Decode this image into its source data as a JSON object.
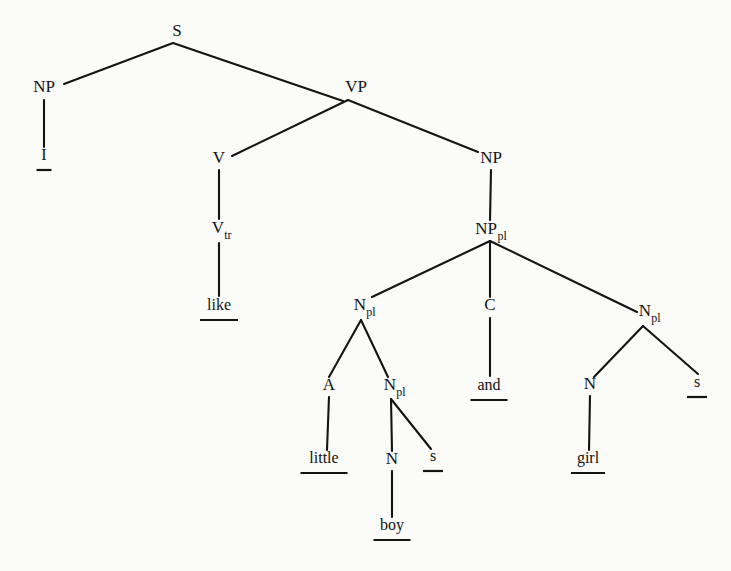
{
  "figure": {
    "name": "constituency-parse-tree",
    "sentence": "I like little boys and girls",
    "background_color": "#fbfbfa",
    "ink_color": "#141414"
  },
  "nodes": [
    {
      "id": "S",
      "label": "S",
      "sub": "",
      "x": 177,
      "y": 36,
      "anchor_x": 173,
      "anchor_y": 43,
      "kind": "nonterminal"
    },
    {
      "id": "NP1",
      "label": "NP",
      "sub": "",
      "x": 44,
      "y": 92,
      "anchor_x": 44,
      "anchor_y": 100,
      "kind": "nonterminal"
    },
    {
      "id": "VP",
      "label": "VP",
      "sub": "",
      "x": 356,
      "y": 92,
      "anchor_x": 348,
      "anchor_y": 100,
      "kind": "nonterminal"
    },
    {
      "id": "V",
      "label": "V",
      "sub": "",
      "x": 219,
      "y": 163,
      "anchor_x": 219,
      "anchor_y": 170,
      "kind": "nonterminal"
    },
    {
      "id": "NP2",
      "label": "NP",
      "sub": "",
      "x": 491,
      "y": 163,
      "anchor_x": 491,
      "anchor_y": 170,
      "kind": "nonterminal"
    },
    {
      "id": "Vtr",
      "label": "V",
      "sub": "tr",
      "x": 218,
      "y": 233,
      "anchor_x": 219,
      "anchor_y": 241,
      "kind": "nonterminal"
    },
    {
      "id": "NPpl",
      "label": "NP",
      "sub": "pl",
      "x": 486,
      "y": 234,
      "anchor_x": 490,
      "anchor_y": 241,
      "kind": "nonterminal"
    },
    {
      "id": "Npl_L",
      "label": "N",
      "sub": "pl",
      "x": 360,
      "y": 310,
      "anchor_x": 361,
      "anchor_y": 319,
      "kind": "nonterminal"
    },
    {
      "id": "C",
      "label": "C",
      "sub": "",
      "x": 490,
      "y": 310,
      "anchor_x": 490,
      "anchor_y": 318,
      "kind": "nonterminal"
    },
    {
      "id": "Npl_R",
      "label": "N",
      "sub": "pl",
      "x": 645,
      "y": 316,
      "anchor_x": 644,
      "anchor_y": 325,
      "kind": "nonterminal"
    },
    {
      "id": "A",
      "label": "A",
      "sub": "",
      "x": 329,
      "y": 390,
      "anchor_x": 329,
      "anchor_y": 397,
      "kind": "nonterminal"
    },
    {
      "id": "Npl_inner",
      "label": "N",
      "sub": "pl",
      "x": 390,
      "y": 390,
      "anchor_x": 391,
      "anchor_y": 398,
      "kind": "nonterminal"
    },
    {
      "id": "N_girl",
      "label": "N",
      "sub": "",
      "x": 590,
      "y": 389,
      "anchor_x": 590,
      "anchor_y": 396,
      "kind": "nonterminal"
    },
    {
      "id": "N_boy",
      "label": "N",
      "sub": "",
      "x": 392,
      "y": 464,
      "anchor_x": 392,
      "anchor_y": 471,
      "kind": "nonterminal"
    }
  ],
  "leaves": [
    {
      "id": "leaf_I",
      "text": "I",
      "x": 44,
      "y": 160,
      "underline_width": 15,
      "underline_y": 170
    },
    {
      "id": "leaf_like",
      "text": "like",
      "x": 219,
      "y": 310,
      "underline_width": 38,
      "underline_y": 320
    },
    {
      "id": "leaf_little",
      "text": "little",
      "x": 324,
      "y": 463,
      "underline_width": 47,
      "underline_y": 473
    },
    {
      "id": "leaf_s1",
      "text": "s",
      "x": 433,
      "y": 461,
      "underline_width": 20,
      "underline_y": 471
    },
    {
      "id": "leaf_and",
      "text": "and",
      "x": 489,
      "y": 390,
      "underline_width": 37,
      "underline_y": 400
    },
    {
      "id": "leaf_girl",
      "text": "girl",
      "x": 588,
      "y": 463,
      "underline_width": 34,
      "underline_y": 473
    },
    {
      "id": "leaf_s2",
      "text": "s",
      "x": 697,
      "y": 387,
      "underline_width": 20,
      "underline_y": 397
    },
    {
      "id": "leaf_boy",
      "text": "boy",
      "x": 392,
      "y": 530,
      "underline_width": 37,
      "underline_y": 540
    }
  ],
  "edges": [
    {
      "id": "e-S-NP1",
      "from": "S",
      "to": "NP1",
      "x1": 173,
      "y1": 43,
      "x2": 64,
      "y2": 84
    },
    {
      "id": "e-S-VP",
      "from": "S",
      "to": "VP",
      "x1": 173,
      "y1": 43,
      "x2": 343,
      "y2": 101
    },
    {
      "id": "e-NP1-I",
      "from": "NP1",
      "to": "leaf_I",
      "x1": 44,
      "y1": 100,
      "x2": 44,
      "y2": 147
    },
    {
      "id": "e-VP-V",
      "from": "VP",
      "to": "V",
      "x1": 348,
      "y1": 100,
      "x2": 232,
      "y2": 156
    },
    {
      "id": "e-VP-NP2",
      "from": "VP",
      "to": "NP2",
      "x1": 348,
      "y1": 100,
      "x2": 478,
      "y2": 152
    },
    {
      "id": "e-V-Vtr",
      "from": "V",
      "to": "Vtr",
      "x1": 219,
      "y1": 170,
      "x2": 219,
      "y2": 219
    },
    {
      "id": "e-Vtr-like",
      "from": "Vtr",
      "to": "leaf_like",
      "x1": 219,
      "y1": 243,
      "x2": 219,
      "y2": 296
    },
    {
      "id": "e-NP2-NPpl",
      "from": "NP2",
      "to": "NPpl",
      "x1": 491,
      "y1": 170,
      "x2": 490,
      "y2": 220
    },
    {
      "id": "e-NPpl-NplL",
      "from": "NPpl",
      "to": "Npl_L",
      "x1": 490,
      "y1": 241,
      "x2": 372,
      "y2": 297
    },
    {
      "id": "e-NPpl-C",
      "from": "NPpl",
      "to": "C",
      "x1": 490,
      "y1": 241,
      "x2": 490,
      "y2": 297
    },
    {
      "id": "e-NPpl-NplR",
      "from": "NPpl",
      "to": "Npl_R",
      "x1": 490,
      "y1": 241,
      "x2": 637,
      "y2": 312
    },
    {
      "id": "e-NplL-A",
      "from": "Npl_L",
      "to": "A",
      "x1": 361,
      "y1": 320,
      "x2": 329,
      "y2": 377
    },
    {
      "id": "e-NplL-Nplinner",
      "from": "Npl_L",
      "to": "Npl_inner",
      "x1": 361,
      "y1": 320,
      "x2": 388,
      "y2": 377
    },
    {
      "id": "e-C-and",
      "from": "C",
      "to": "leaf_and",
      "x1": 490,
      "y1": 318,
      "x2": 490,
      "y2": 376
    },
    {
      "id": "e-NplR-N",
      "from": "Npl_R",
      "to": "N_girl",
      "x1": 643,
      "y1": 326,
      "x2": 594,
      "y2": 377
    },
    {
      "id": "e-NplR-s",
      "from": "Npl_R",
      "to": "leaf_s2",
      "x1": 643,
      "y1": 326,
      "x2": 698,
      "y2": 374
    },
    {
      "id": "e-A-little",
      "from": "A",
      "to": "leaf_little",
      "x1": 329,
      "y1": 397,
      "x2": 327,
      "y2": 450
    },
    {
      "id": "e-Nplinner-N",
      "from": "Npl_inner",
      "to": "N_boy",
      "x1": 391,
      "y1": 399,
      "x2": 392,
      "y2": 451
    },
    {
      "id": "e-Nplinner-s",
      "from": "Npl_inner",
      "to": "leaf_s1",
      "x1": 391,
      "y1": 399,
      "x2": 431,
      "y2": 449
    },
    {
      "id": "e-N-girl",
      "from": "N_girl",
      "to": "leaf_girl",
      "x1": 590,
      "y1": 396,
      "x2": 589,
      "y2": 450
    },
    {
      "id": "e-N-boy",
      "from": "N_boy",
      "to": "leaf_boy",
      "x1": 392,
      "y1": 471,
      "x2": 392,
      "y2": 517
    }
  ]
}
